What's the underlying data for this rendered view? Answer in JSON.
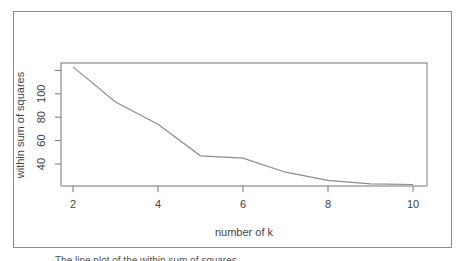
{
  "chart_data": {
    "type": "line",
    "title": "",
    "xlabel": "number of k",
    "ylabel": "within sum of squares",
    "x": [
      2,
      3,
      4,
      5,
      6,
      7,
      8,
      9,
      10
    ],
    "series": [
      {
        "name": "within sum of squares",
        "values": [
          123,
          93,
          74,
          47,
          45,
          33,
          26,
          23,
          22.5
        ]
      }
    ],
    "xticks": [
      "2",
      "4",
      "6",
      "8",
      "10"
    ],
    "xtick_values": [
      2,
      4,
      6,
      8,
      10
    ],
    "yticks": [
      "40",
      "60",
      "80",
      "100"
    ],
    "ytick_values": [
      40,
      60,
      80,
      100,
      120
    ],
    "xlim": [
      1.7,
      10.3
    ],
    "ylim": [
      19,
      126
    ],
    "grid": false,
    "legend": "none",
    "line_color": "#8c8c8c"
  },
  "caption": "The line plot of the within sum of squares"
}
